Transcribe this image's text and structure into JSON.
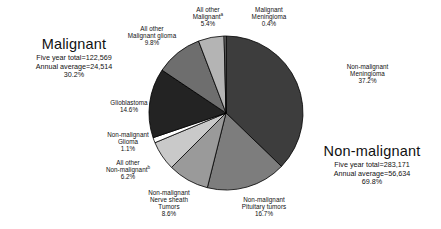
{
  "chart_data": {
    "type": "pie",
    "title": "",
    "legend_position": "labels-outside",
    "categories": [
      "Non-malignant Meningioma",
      "Non-malignant Pituitary tumors",
      "Non-malignant Nerve sheath Tumors",
      "All other Non-malignant",
      "Non-malignant Glioma",
      "Glioblastoma",
      "All other Malignant glioma",
      "All other Malignant",
      "Malignant Meningioma"
    ],
    "values": [
      37.2,
      16.7,
      8.6,
      6.2,
      1.1,
      14.6,
      9.8,
      5.4,
      0.4
    ],
    "units": "percent",
    "colors": [
      "#3d3d3d",
      "#7d7d7d",
      "#9a9a9a",
      "#c9c9c9",
      "#ffffff",
      "#232323",
      "#6e6e6e",
      "#b4b4b4",
      "#8a8a8a"
    ],
    "groups": [
      {
        "name": "Malignant",
        "percent": 30.2,
        "five_year_total": "122,569",
        "annual_average": "24,514"
      },
      {
        "name": "Non-malignant",
        "percent": 69.8,
        "five_year_total": "283,171",
        "annual_average": "56,634"
      }
    ]
  },
  "slices": [
    {
      "name": "Non-malignant Meningioma",
      "line1": "Non-malignant",
      "line2": "Meningioma",
      "pct": "37.2%"
    },
    {
      "name": "Non-malignant Pituitary tumors",
      "line1": "Non-malignant",
      "line2": "Pituitary tumors",
      "pct": "16.7%"
    },
    {
      "name": "Non-malignant Nerve sheath Tumors",
      "line1": "Non-malignant",
      "line2": "Nerve sheath",
      "line3": "Tumors",
      "pct": "8.6%"
    },
    {
      "name": "All other Non-malignant",
      "line1": "All other",
      "line2": "Non-malignant",
      "sup": "b",
      "pct": "6.2%"
    },
    {
      "name": "Non-malignant Glioma",
      "line1": "Non-malignant",
      "line2": "Glioma",
      "pct": "1.1%"
    },
    {
      "name": "Glioblastoma",
      "line1": "Glioblastoma",
      "pct": "14.6%"
    },
    {
      "name": "All other Malignant glioma",
      "line1": "All other",
      "line2": "Malignant glioma",
      "pct": "9.8%"
    },
    {
      "name": "All other Malignant",
      "line1": "All other",
      "line2": "Malignant",
      "sup": "a",
      "pct": "5.4%"
    },
    {
      "name": "Malignant Meningioma",
      "line1": "Malignant",
      "line2": "Meningioma",
      "pct": "0.4%"
    }
  ],
  "summary": {
    "malignant": {
      "heading": "Malignant",
      "five_year": "Five year total=122,569",
      "annual": "Annual average=24,514",
      "pct": "30.2%"
    },
    "nonmalignant": {
      "heading": "Non-malignant",
      "five_year": "Five year total=283,171",
      "annual": "Annual average=56,634",
      "pct": "69.8%"
    }
  }
}
